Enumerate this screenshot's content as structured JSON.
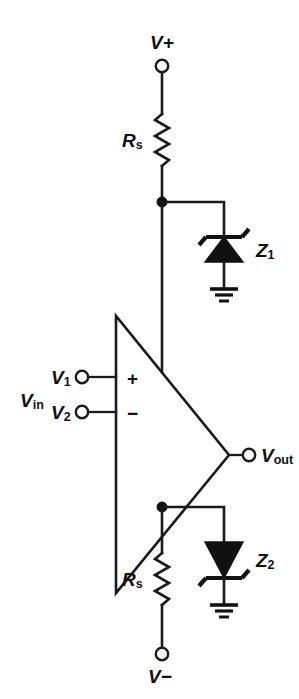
{
  "diagram": {
    "type": "schematic",
    "line_color": "#1a1a1a",
    "fill_color": "#111111",
    "background": "#ffffff"
  },
  "labels": {
    "v_plus": "V+",
    "v_minus": "V−",
    "rs_top": "R",
    "rs_top_sub": "s",
    "rs_bottom": "R",
    "rs_bottom_sub": "s",
    "z1": "Z",
    "z1_sub": "1",
    "z2": "Z",
    "z2_sub": "2",
    "v1": "V",
    "v1_sub": "1",
    "v2": "V",
    "v2_sub": "2",
    "vin": "V",
    "vin_sub": "in",
    "vout": "V",
    "vout_sub": "out",
    "plus_input": "+",
    "minus_input": "−"
  },
  "components": {
    "terminals": [
      "V+",
      "V−",
      "V1",
      "V2",
      "Vout"
    ],
    "resistors": [
      "Rs",
      "Rs"
    ],
    "zener_diodes": [
      "Z1",
      "Z2"
    ],
    "grounds": 2,
    "opamp": {
      "inputs": [
        "+",
        "−"
      ],
      "output": "Vout",
      "supplies": [
        "V+",
        "V−"
      ]
    },
    "nodes": 2
  }
}
